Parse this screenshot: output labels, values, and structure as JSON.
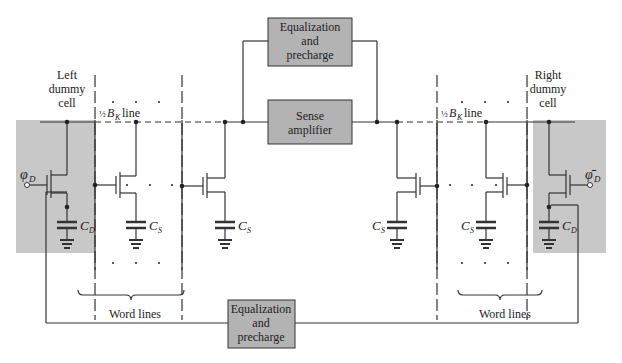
{
  "colors": {
    "wire": "#333333",
    "box_fill": "#b3b3b3",
    "shade_fill": "#c8c8c8",
    "text": "#222222"
  },
  "blocks": {
    "eq_top": [
      "Equalization",
      "and",
      "precharge"
    ],
    "sense_amp": [
      "Sense",
      "amplifier"
    ],
    "eq_bottom": [
      "Equalization",
      "and",
      "precharge"
    ]
  },
  "labels": {
    "left_dummy": [
      "Left",
      "dummy",
      "cell"
    ],
    "right_dummy": [
      "Right",
      "dummy",
      "cell"
    ],
    "half_left": "½",
    "bk_left": "B",
    "bk_sub": "K",
    "line_word": "line",
    "phi_left": "φ",
    "phi_sub": "D",
    "phi_right": "φ̄",
    "cd": "C",
    "cd_sub": "D",
    "cs": "C",
    "cs_sub": "S",
    "word_lines_left": "Word lines",
    "word_lines_right": "Word lines",
    "ellipsis_dots": "·   ·   ·"
  }
}
